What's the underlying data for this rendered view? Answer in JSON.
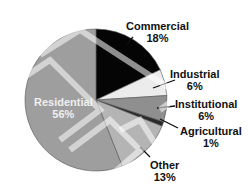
{
  "chart_data": {
    "type": "pie",
    "title": "",
    "start_angle_deg": 0,
    "direction": "clockwise",
    "slices": [
      {
        "label": "Commercial",
        "value": 18,
        "display": "18%",
        "color": "#050505"
      },
      {
        "label": "Industrial",
        "value": 6,
        "display": "6%",
        "color": "#ececec"
      },
      {
        "label": "Institutional",
        "value": 6,
        "display": "6%",
        "color": "#8f8f8f"
      },
      {
        "label": "Agricultural",
        "value": 1,
        "display": "1%",
        "color": "#2a2a2a"
      },
      {
        "label": "Other",
        "value": 13,
        "display": "13%",
        "color": "#b4b4b4"
      },
      {
        "label": "Residential",
        "value": 56,
        "display": "56%",
        "color": "#9e9e9e"
      }
    ],
    "legend": "none (labels on/near slices)"
  },
  "labels": {
    "commercial": {
      "name": "Commercial",
      "pct": "18%"
    },
    "industrial": {
      "name": "Industrial",
      "pct": "6%"
    },
    "institutional": {
      "name": "Institutional",
      "pct": "6%"
    },
    "agricultural": {
      "name": "Agricultural",
      "pct": "1%"
    },
    "other": {
      "name": "Other",
      "pct": "13%"
    },
    "residential": {
      "name": "Residential",
      "pct": "56%"
    }
  }
}
